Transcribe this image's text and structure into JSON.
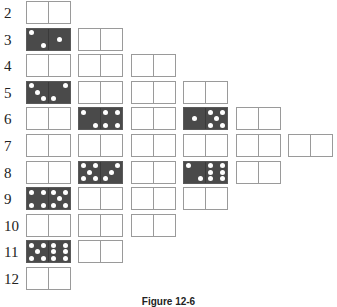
{
  "figure": {
    "caption": "Figure 12-6",
    "colors": {
      "filled": "#4a4a4a",
      "border": "#9a9a9a",
      "pip": "#ffffff"
    },
    "rows": [
      {
        "label": "2",
        "count": 1,
        "filled": []
      },
      {
        "label": "3",
        "count": 2,
        "filled": [
          {
            "col": 0,
            "left": 2,
            "right": 1
          }
        ]
      },
      {
        "label": "4",
        "count": 3,
        "filled": []
      },
      {
        "label": "5",
        "count": 4,
        "filled": [
          {
            "col": 0,
            "left": 3,
            "right": 2
          }
        ]
      },
      {
        "label": "6",
        "count": 5,
        "filled": [
          {
            "col": 1,
            "left": 2,
            "right": 4
          },
          {
            "col": 3,
            "left": 1,
            "right": 5
          }
        ]
      },
      {
        "label": "7",
        "count": 6,
        "filled": []
      },
      {
        "label": "8",
        "count": 5,
        "filled": [
          {
            "col": 1,
            "left": 5,
            "right": 3
          },
          {
            "col": 3,
            "left": 2,
            "right": 6
          }
        ]
      },
      {
        "label": "9",
        "count": 4,
        "filled": [
          {
            "col": 0,
            "left": 4,
            "right": 5
          }
        ]
      },
      {
        "label": "10",
        "count": 3,
        "filled": []
      },
      {
        "label": "11",
        "count": 2,
        "filled": [
          {
            "col": 0,
            "left": 5,
            "right": 6
          }
        ]
      },
      {
        "label": "12",
        "count": 1,
        "filled": []
      }
    ]
  }
}
